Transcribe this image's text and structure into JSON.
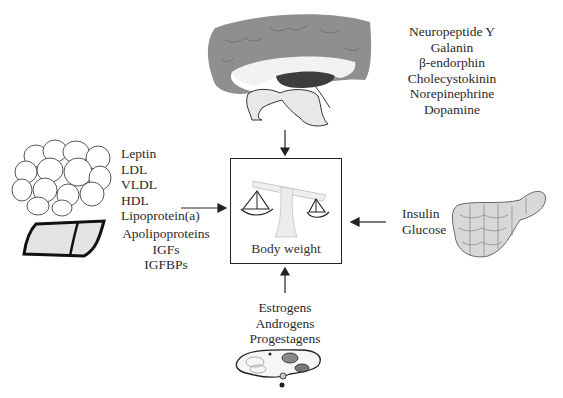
{
  "diagram": {
    "center": {
      "label": "Body weight",
      "icon": "balance-scale-icon"
    },
    "brain": {
      "icon": "brain-icon",
      "factors": [
        "Neuropeptide Y",
        "Galanin",
        "β-endorphin",
        "Cholecystokinin",
        "Norepinephrine",
        "Dopamine"
      ]
    },
    "adipose_liver": {
      "icons": [
        "adipose-tissue-icon",
        "liver-icon"
      ],
      "factors_upper": [
        "Leptin",
        "LDL",
        "VLDL",
        "HDL",
        "Lipoprotein(a)"
      ],
      "factors_lower": [
        "Apolipoproteins",
        "IGFs",
        "IGFBPs"
      ]
    },
    "pancreas": {
      "icon": "pancreas-icon",
      "factors": [
        "Insulin",
        "Glucose"
      ]
    },
    "gonads": {
      "icon": "ovary-icon",
      "factors": [
        "Estrogens",
        "Androgens",
        "Progestagens"
      ]
    },
    "colors": {
      "brain_gray": "#8a8a8a",
      "brain_dark": "#4a4a4a",
      "light_fill": "#e6e6e6",
      "ink": "#222222"
    }
  }
}
